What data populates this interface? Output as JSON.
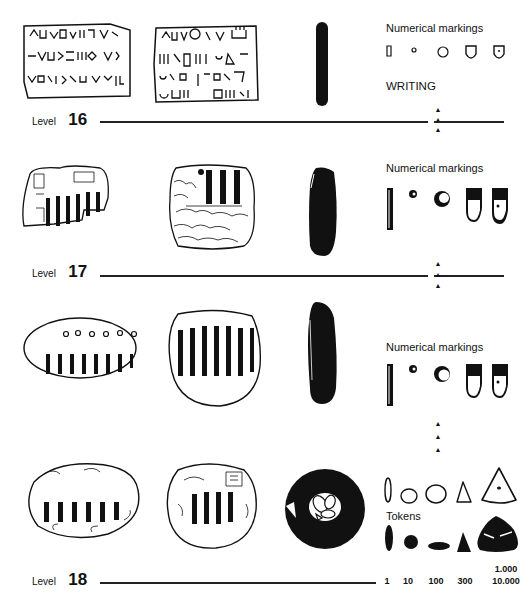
{
  "levels": [
    {
      "word": "Level",
      "number": "16"
    },
    {
      "word": "Level",
      "number": "17"
    },
    {
      "word": "Level",
      "number": "18"
    }
  ],
  "sections": {
    "level16_heading": "Numerical markings",
    "writing_heading": "WRITING",
    "level17_heading": "Numerical markings",
    "level18_heading": "Numerical markings",
    "tokens_heading": "Tokens"
  },
  "arrow_glyph": "▲",
  "token_values": [
    "1",
    "10",
    "100",
    "300",
    "10.000"
  ],
  "token_value_extra": "1.000"
}
